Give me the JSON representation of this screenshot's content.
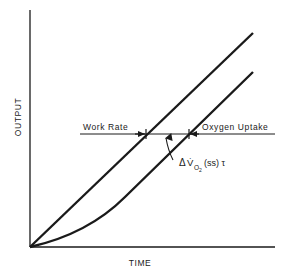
{
  "diagram": {
    "axes": {
      "x_label": "TIME",
      "y_label": "OUTPUT"
    },
    "curves": [
      {
        "name": "Work Rate",
        "shape": "linear ramp from origin"
      },
      {
        "name": "Oxygen Uptake",
        "shape": "exponential onset, then linear parallel to work rate"
      }
    ],
    "labels": {
      "work_rate": "Work Rate",
      "oxygen_uptake": "Oxygen Uptake",
      "delta_prefix": "Δ",
      "delta_v": "V̇",
      "delta_sub": "O",
      "delta_sub2": "2",
      "delta_suffix": "(ss) τ"
    },
    "colors": {
      "ink": "#1a1a1a",
      "background": "#ffffff"
    }
  }
}
